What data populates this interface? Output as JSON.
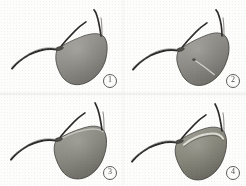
{
  "figure": {
    "type": "specimen-photograph-plate",
    "layout": "2x2 grid",
    "background_color": "#ffffff",
    "image_rendering": "grayscale photographic",
    "panel_count": 4
  },
  "panels": [
    {
      "index_label": "①",
      "index_number": "1",
      "position": "top-left",
      "body_fill": "#8b8a85",
      "outline_color": "#2b2a28",
      "description": "slender curved stalk meeting a broad shaded teardrop-shaped blade, smooth uninterrupted blade surface"
    },
    {
      "index_label": "②",
      "index_number": "2",
      "position": "top-right",
      "body_fill": "#898883",
      "outline_color": "#2b2a28",
      "description": "same structure with a narrow pale diagonal ridge crossing the lower right of the blade"
    },
    {
      "index_label": "③",
      "index_number": "3",
      "position": "bottom-left",
      "body_fill": "#87867f",
      "outline_color": "#2b2a28",
      "description": "broader rounded blade with a faint light line along the upper margin"
    },
    {
      "index_label": "④",
      "index_number": "4",
      "position": "bottom-right",
      "body_fill": "#858479",
      "outline_color": "#2b2a28",
      "description": "blade with a pronounced pale crescent arc separating the upper rim from the shaded body"
    }
  ],
  "colors": {
    "page_background": "#ffffff",
    "specimen_dark": "#2b2a28",
    "specimen_mid": "#8b8a85",
    "specimen_light": "#d9d8d2",
    "seam_gray": "#ececE9",
    "label_ink": "#39393a"
  }
}
